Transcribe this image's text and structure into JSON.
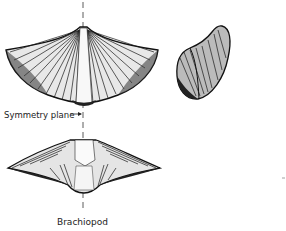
{
  "figure": {
    "caption": "Brachiopod",
    "annotations": [
      {
        "id": "symmetry",
        "text": "Symmetry plane",
        "arrow": "right"
      }
    ],
    "views": [
      {
        "name": "dorsal view",
        "description": "fan-shaped valve with radiating ribs and smooth central fold"
      },
      {
        "name": "side view",
        "description": "lateral profile showing curved beak"
      },
      {
        "name": "anterior view",
        "description": "front view showing hinge line and sulcus"
      }
    ],
    "colors": {
      "ink": "#1a1a1a",
      "background": "#ffffff"
    }
  }
}
